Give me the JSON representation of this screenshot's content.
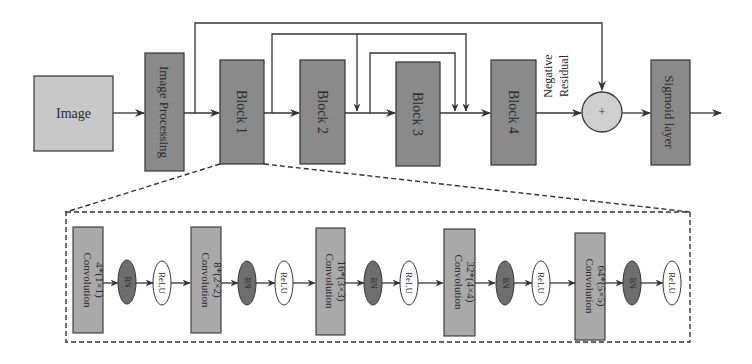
{
  "diagram": {
    "top_flow": {
      "input": {
        "label": "Image",
        "color": "#c8c8c8"
      },
      "preprocess": {
        "label": "Image Processing",
        "color": "#8a8a8a"
      },
      "blocks": [
        {
          "label": "Block 1",
          "color": "#8a8a8a"
        },
        {
          "label": "Block 2",
          "color": "#8a8a8a"
        },
        {
          "label": "Block 3",
          "color": "#8a8a8a"
        },
        {
          "label": "Block 4",
          "color": "#8a8a8a"
        }
      ],
      "residual_label_line1": "Negative",
      "residual_label_line2": "Residual",
      "sum_node": {
        "symbol": "+",
        "color": "#cfcfcf"
      },
      "output": {
        "label": "Sigmoid layer",
        "color": "#8a8a8a"
      }
    },
    "block_detail": {
      "expands": "Block 1",
      "stages": [
        {
          "conv_label": "Convolution",
          "conv_param": "4*(1×1)",
          "bn": "BN",
          "relu": "ReLU"
        },
        {
          "conv_label": "Convolution",
          "conv_param": "8*(2×2)",
          "bn": "BN",
          "relu": "ReLU"
        },
        {
          "conv_label": "Convolution",
          "conv_param": "16*(3×3)",
          "bn": "BN",
          "relu": "ReLU"
        },
        {
          "conv_label": "Convolution",
          "conv_param": "32*(4×4)",
          "bn": "BN",
          "relu": "ReLU"
        },
        {
          "conv_label": "Convolution",
          "conv_param": "64*(5×5)",
          "bn": "BN",
          "relu": "ReLU"
        }
      ],
      "conv_color": "#a9a9a9",
      "bn_color": "#6e6e6e",
      "relu_color": "#ffffff"
    },
    "line_color": "#333333"
  }
}
